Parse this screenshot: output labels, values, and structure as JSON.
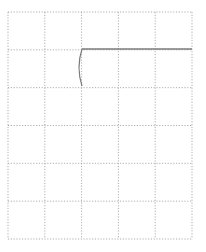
{
  "diagram": {
    "background": "#ffffff",
    "grid": {
      "left": 8,
      "top": 12,
      "right": 192,
      "bottom": 239,
      "columns": 5,
      "rows": 6,
      "line_color": "#9a9a9a",
      "line_style": "dotted"
    },
    "drawing": {
      "stroke_color": "#7a7a7a",
      "horizontal_line": {
        "x1": 82,
        "y1": 49,
        "x2": 192,
        "y2": 49
      },
      "curve": {
        "x1": 82,
        "y1": 49,
        "cx": 76,
        "cy": 67.5,
        "x2": 82,
        "y2": 86
      }
    }
  }
}
